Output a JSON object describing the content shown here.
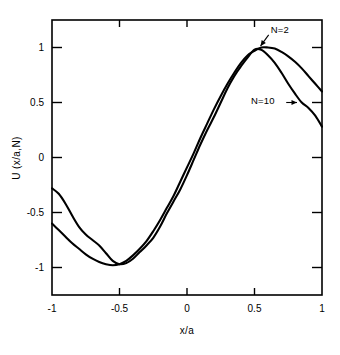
{
  "chart_data": {
    "type": "line",
    "title": "",
    "subtitle": "",
    "xlabel": "x/a",
    "ylabel": "U (x/a,N)",
    "xlim": [
      -1,
      1
    ],
    "ylim": [
      -1.25,
      1.25
    ],
    "grid": false,
    "legend_position": "inline-annotations",
    "xticks": [
      -1,
      -0.5,
      0,
      0.5,
      1
    ],
    "xticklabels": [
      "-1",
      "-0.5",
      "0",
      "0.5",
      "1"
    ],
    "yticks": [
      -1,
      -0.5,
      0,
      0.5,
      1
    ],
    "yticklabels": [
      "-1",
      "-0.5",
      "0",
      "0.5",
      "1"
    ],
    "annotations": [
      {
        "text": "N=2",
        "x": 0.62,
        "y": 1.16
      },
      {
        "text": "N=10",
        "x": 0.65,
        "y": 0.52
      }
    ],
    "series": [
      {
        "name": "N=2",
        "label": "N=2",
        "color": "#000000",
        "x": [
          -1.0,
          -0.95,
          -0.9,
          -0.85,
          -0.8,
          -0.75,
          -0.7,
          -0.65,
          -0.6,
          -0.55,
          -0.5,
          -0.45,
          -0.4,
          -0.35,
          -0.3,
          -0.25,
          -0.2,
          -0.15,
          -0.1,
          -0.05,
          0.0,
          0.05,
          0.1,
          0.15,
          0.2,
          0.25,
          0.3,
          0.35,
          0.4,
          0.45,
          0.5,
          0.55,
          0.6,
          0.65,
          0.7,
          0.75,
          0.8,
          0.85,
          0.9,
          0.95,
          1.0
        ],
        "y": [
          -0.6,
          -0.66,
          -0.72,
          -0.78,
          -0.83,
          -0.88,
          -0.92,
          -0.95,
          -0.97,
          -0.98,
          -0.97,
          -0.94,
          -0.89,
          -0.83,
          -0.76,
          -0.67,
          -0.57,
          -0.46,
          -0.35,
          -0.22,
          -0.09,
          0.04,
          0.18,
          0.31,
          0.44,
          0.56,
          0.67,
          0.77,
          0.86,
          0.93,
          0.97,
          1.0,
          1.0,
          0.99,
          0.96,
          0.92,
          0.87,
          0.81,
          0.74,
          0.67,
          0.6
        ]
      },
      {
        "name": "N=10",
        "label": "N=10",
        "color": "#000000",
        "x": [
          -1.0,
          -0.95,
          -0.9,
          -0.85,
          -0.8,
          -0.75,
          -0.7,
          -0.65,
          -0.6,
          -0.55,
          -0.5,
          -0.45,
          -0.4,
          -0.35,
          -0.3,
          -0.25,
          -0.2,
          -0.15,
          -0.1,
          -0.05,
          0.0,
          0.05,
          0.1,
          0.15,
          0.2,
          0.25,
          0.3,
          0.35,
          0.4,
          0.45,
          0.5,
          0.55,
          0.6,
          0.65,
          0.7,
          0.75,
          0.8,
          0.85,
          0.9,
          0.95,
          1.0
        ],
        "y": [
          -0.28,
          -0.33,
          -0.42,
          -0.53,
          -0.63,
          -0.7,
          -0.75,
          -0.8,
          -0.87,
          -0.94,
          -0.97,
          -0.96,
          -0.92,
          -0.86,
          -0.8,
          -0.73,
          -0.63,
          -0.51,
          -0.4,
          -0.29,
          -0.16,
          -0.02,
          0.12,
          0.25,
          0.37,
          0.5,
          0.63,
          0.74,
          0.83,
          0.91,
          0.98,
          0.98,
          0.93,
          0.86,
          0.77,
          0.67,
          0.58,
          0.5,
          0.45,
          0.38,
          0.28
        ]
      }
    ]
  }
}
